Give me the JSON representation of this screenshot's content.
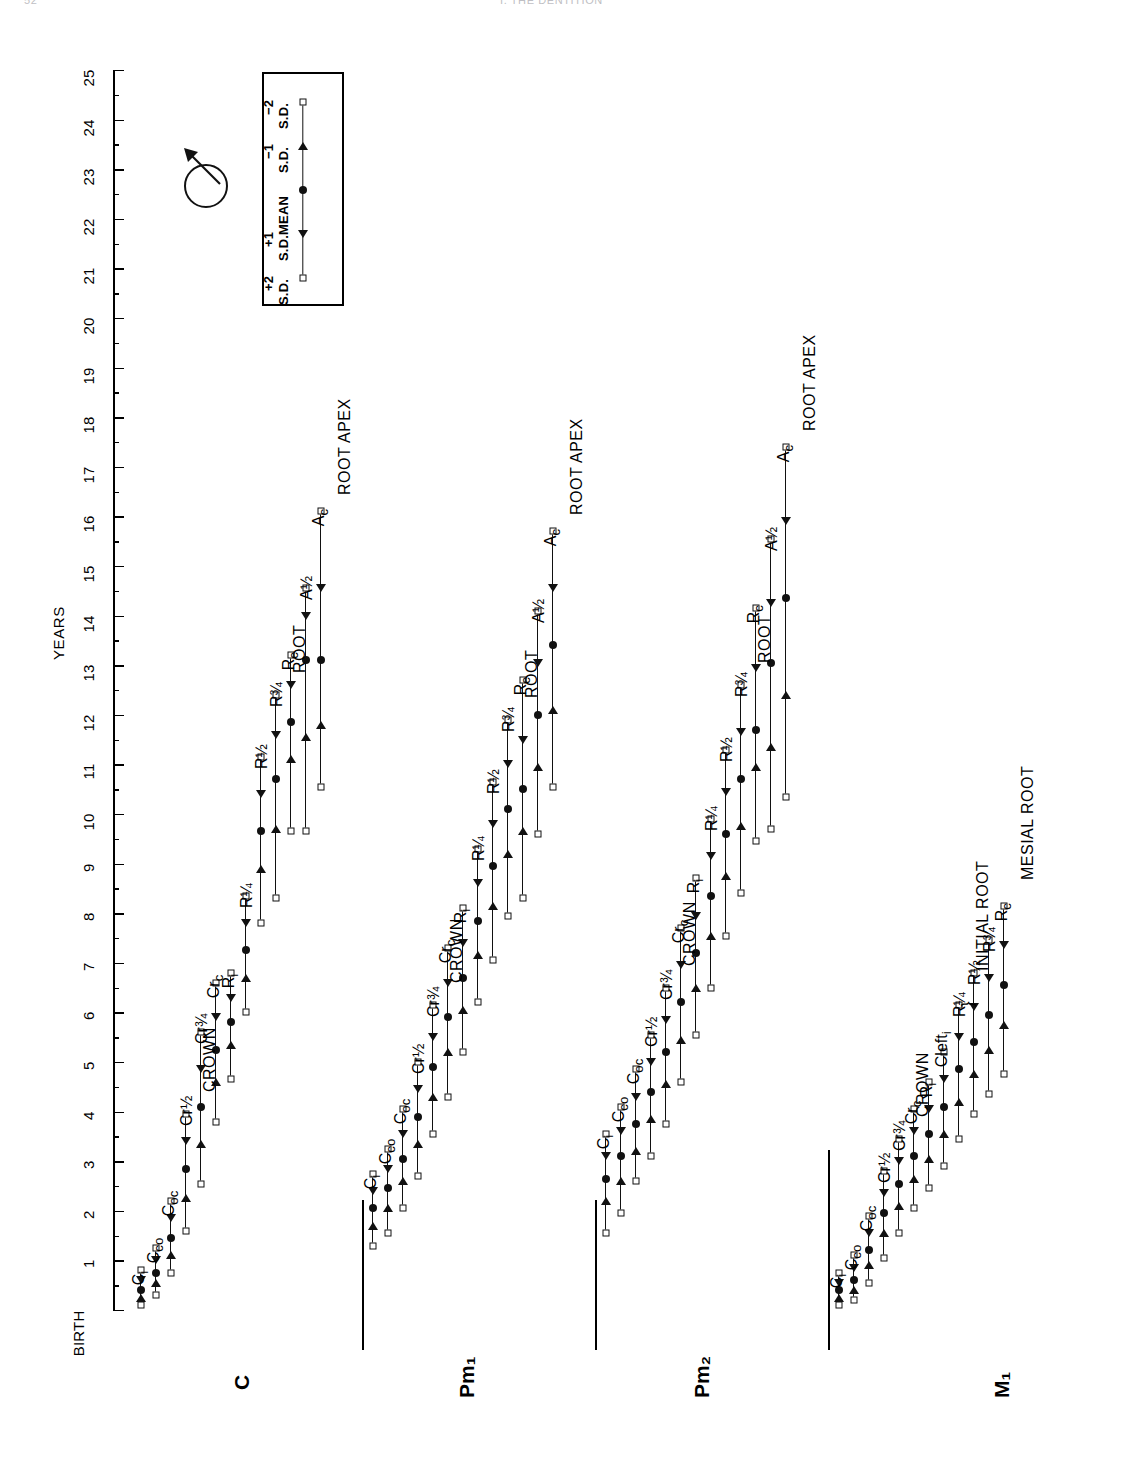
{
  "runhead": {
    "page": "52",
    "title": "I. THE DENTITION"
  },
  "axis": {
    "title": "YEARS",
    "origin_label": "BIRTH",
    "ticks": [
      "1",
      "2",
      "3",
      "4",
      "5",
      "6",
      "7",
      "8",
      "9",
      "10",
      "11",
      "12",
      "13",
      "14",
      "15",
      "16",
      "17",
      "18",
      "19",
      "20",
      "21",
      "22",
      "23",
      "24",
      "25"
    ],
    "min": 0,
    "max": 25
  },
  "legend": {
    "items": [
      {
        "label": "−2\nS.D.",
        "symbol": "square"
      },
      {
        "label": "−1\nS.D.",
        "symbol": "triangle"
      },
      {
        "label": "MEAN",
        "symbol": "circle"
      },
      {
        "label": "+1\nS.D.",
        "symbol": "triangle"
      },
      {
        "label": "+2\nS.D.",
        "symbol": "square"
      }
    ],
    "text_m2": "−2",
    "text_m2b": "S.D.",
    "text_m1": "−1",
    "text_m1b": "S.D.",
    "text_mean": "MEAN",
    "text_p1": "+1",
    "text_p1b": "S.D.",
    "text_p2": "+2",
    "text_p2b": "S.D."
  },
  "sex_symbol": {
    "name": "male-symbol",
    "meaning": "males"
  },
  "chart_data": {
    "type": "line",
    "xlabel": "YEARS",
    "ylabel": "",
    "xlim": [
      0,
      25
    ],
    "grid": false,
    "legend_position": "top-left-box",
    "marker_meaning": [
      "-2 S.D. (square)",
      "-1 S.D. (triangle)",
      "MEAN (filled circle)",
      "+1 S.D. (triangle)",
      "+2 S.D. (square)"
    ],
    "series": [
      {
        "name": "C",
        "group_labels": [
          "CROWN",
          "ROOT",
          "ROOT APEX"
        ],
        "stages": [
          {
            "stage": "Cᵢ",
            "label_html": "C<sub>i</sub>",
            "m2": 0.1,
            "m1": 0.25,
            "mean": 0.4,
            "p1": 0.6,
            "p2": 0.8
          },
          {
            "stage": "C_co",
            "label_html": "C<sub>co</sub>",
            "m2": 0.3,
            "m1": 0.55,
            "mean": 0.75,
            "p1": 1.0,
            "p2": 1.25
          },
          {
            "stage": "C_oc",
            "label_html": "C<sub>oc</sub>",
            "m2": 0.75,
            "m1": 1.1,
            "mean": 1.45,
            "p1": 1.85,
            "p2": 2.2
          },
          {
            "stage": "Cr½",
            "label_html": "Cr&frac12;",
            "m2": 1.6,
            "m1": 2.25,
            "mean": 2.85,
            "p1": 3.4,
            "p2": 3.95
          },
          {
            "stage": "Cr¾",
            "label_html": "Cr&frac34;",
            "m2": 2.55,
            "m1": 3.35,
            "mean": 4.1,
            "p1": 4.85,
            "p2": 5.6
          },
          {
            "stage": "Cr_c",
            "label_html": "Cr<sub>c</sub>",
            "m2": 3.8,
            "m1": 4.6,
            "mean": 5.25,
            "p1": 5.9,
            "p2": 6.6
          },
          {
            "stage": "Rᵢ",
            "label_html": "R<sub>i</sub>",
            "m2": 4.65,
            "m1": 5.35,
            "mean": 5.8,
            "p1": 6.3,
            "p2": 6.8
          },
          {
            "stage": "R¼",
            "label_html": "R&frac14;",
            "m2": 6.0,
            "m1": 6.7,
            "mean": 7.25,
            "p1": 7.8,
            "p2": 8.35
          },
          {
            "stage": "R½",
            "label_html": "R&frac12;",
            "m2": 7.8,
            "m1": 8.9,
            "mean": 9.65,
            "p1": 10.4,
            "p2": 11.15
          },
          {
            "stage": "R¾",
            "label_html": "R&frac34;",
            "m2": 8.3,
            "m1": 9.7,
            "mean": 10.7,
            "p1": 11.6,
            "p2": 12.4
          },
          {
            "stage": "R_c",
            "label_html": "R<sub>c</sub>",
            "m2": 9.65,
            "m1": 11.1,
            "mean": 11.85,
            "p1": 12.6,
            "p2": 13.2
          },
          {
            "stage": "A½",
            "label_html": "A&frac12;",
            "m2": 9.65,
            "m1": 11.55,
            "mean": 13.1,
            "p1": 14.0,
            "p2": 14.55
          },
          {
            "stage": "A_c",
            "label_html": "A<sub>c</sub>",
            "m2": 10.55,
            "m1": 11.8,
            "mean": 13.1,
            "p1": 14.55,
            "p2": 16.1
          }
        ]
      },
      {
        "name": "Pm₁",
        "group_labels": [
          "CROWN",
          "ROOT",
          "ROOT APEX"
        ],
        "stages": [
          {
            "stage": "Cᵢ",
            "label_html": "C<sub>i</sub>",
            "m2": 1.3,
            "m1": 1.7,
            "mean": 2.05,
            "p1": 2.4,
            "p2": 2.75
          },
          {
            "stage": "C_co",
            "label_html": "C<sub>co</sub>",
            "m2": 1.55,
            "m1": 2.05,
            "mean": 2.45,
            "p1": 2.85,
            "p2": 3.25
          },
          {
            "stage": "C_oc",
            "label_html": "C<sub>oc</sub>",
            "m2": 2.05,
            "m1": 2.6,
            "mean": 3.05,
            "p1": 3.55,
            "p2": 4.05
          },
          {
            "stage": "Cr½",
            "label_html": "Cr&frac12;",
            "m2": 2.7,
            "m1": 3.35,
            "mean": 3.9,
            "p1": 4.45,
            "p2": 5.0
          },
          {
            "stage": "Cr¾",
            "label_html": "Cr&frac34;",
            "m2": 3.55,
            "m1": 4.3,
            "mean": 4.9,
            "p1": 5.5,
            "p2": 6.15
          },
          {
            "stage": "Cr_c",
            "label_html": "Cr<sub>c</sub>",
            "m2": 4.3,
            "m1": 5.2,
            "mean": 5.9,
            "p1": 6.6,
            "p2": 7.3
          },
          {
            "stage": "Rᵢ",
            "label_html": "R<sub>i</sub>",
            "m2": 5.2,
            "m1": 6.05,
            "mean": 6.7,
            "p1": 7.4,
            "p2": 8.1
          },
          {
            "stage": "R¼",
            "label_html": "R&frac14;",
            "m2": 6.2,
            "m1": 7.15,
            "mean": 7.85,
            "p1": 8.6,
            "p2": 9.3
          },
          {
            "stage": "R½",
            "label_html": "R&frac12;",
            "m2": 7.05,
            "m1": 8.15,
            "mean": 8.95,
            "p1": 9.8,
            "p2": 10.65
          },
          {
            "stage": "R¾",
            "label_html": "R&frac34;",
            "m2": 7.95,
            "m1": 9.2,
            "mean": 10.1,
            "p1": 11.0,
            "p2": 11.9
          },
          {
            "stage": "R_c",
            "label_html": "R<sub>c</sub>",
            "m2": 8.3,
            "m1": 9.65,
            "mean": 10.5,
            "p1": 11.5,
            "p2": 12.7
          },
          {
            "stage": "A½",
            "label_html": "A&frac12;",
            "m2": 9.6,
            "m1": 10.95,
            "mean": 12.0,
            "p1": 13.05,
            "p2": 14.1
          },
          {
            "stage": "A_c",
            "label_html": "A<sub>c</sub>",
            "m2": 10.55,
            "m1": 12.1,
            "mean": 13.4,
            "p1": 14.55,
            "p2": 15.7
          }
        ]
      },
      {
        "name": "Pm₂",
        "group_labels": [
          "CROWN",
          "ROOT",
          "ROOT APEX"
        ],
        "stages": [
          {
            "stage": "Cᵢ",
            "label_html": "C<sub>i</sub>",
            "m2": 1.55,
            "m1": 2.2,
            "mean": 2.65,
            "p1": 3.1,
            "p2": 3.55
          },
          {
            "stage": "C_co",
            "label_html": "C<sub>co</sub>",
            "m2": 1.95,
            "m1": 2.6,
            "mean": 3.1,
            "p1": 3.6,
            "p2": 4.1
          },
          {
            "stage": "C_oc",
            "label_html": "C<sub>oc</sub>",
            "m2": 2.6,
            "m1": 3.2,
            "mean": 3.75,
            "p1": 4.3,
            "p2": 4.85
          },
          {
            "stage": "Cr½",
            "label_html": "Cr&frac12;",
            "m2": 3.1,
            "m1": 3.85,
            "mean": 4.4,
            "p1": 5.0,
            "p2": 5.55
          },
          {
            "stage": "Cr¾",
            "label_html": "Cr&frac34;",
            "m2": 3.75,
            "m1": 4.55,
            "mean": 5.2,
            "p1": 5.85,
            "p2": 6.5
          },
          {
            "stage": "Cr_c",
            "label_html": "Cr<sub>c</sub>",
            "m2": 4.6,
            "m1": 5.45,
            "mean": 6.2,
            "p1": 6.95,
            "p2": 7.7
          },
          {
            "stage": "Rᵢ",
            "label_html": "R<sub>i</sub>",
            "m2": 5.55,
            "m1": 6.5,
            "mean": 7.2,
            "p1": 7.95,
            "p2": 8.7
          },
          {
            "stage": "R¼",
            "label_html": "R&frac14;",
            "m2": 6.5,
            "m1": 7.55,
            "mean": 8.35,
            "p1": 9.15,
            "p2": 9.9
          },
          {
            "stage": "R½",
            "label_html": "R&frac12;",
            "m2": 7.55,
            "m1": 8.75,
            "mean": 9.6,
            "p1": 10.45,
            "p2": 11.3
          },
          {
            "stage": "R¾",
            "label_html": "R&frac34;",
            "m2": 8.4,
            "m1": 9.75,
            "mean": 10.7,
            "p1": 11.65,
            "p2": 12.6
          },
          {
            "stage": "R_c",
            "label_html": "R<sub>c</sub>",
            "m2": 9.45,
            "m1": 10.95,
            "mean": 11.7,
            "p1": 12.95,
            "p2": 14.15
          },
          {
            "stage": "A½",
            "label_html": "A&frac12;",
            "m2": 9.7,
            "m1": 11.35,
            "mean": 13.05,
            "p1": 14.25,
            "p2": 15.55
          },
          {
            "stage": "A_c",
            "label_html": "A<sub>c</sub>",
            "m2": 10.35,
            "m1": 12.4,
            "mean": 14.35,
            "p1": 15.9,
            "p2": 17.4
          }
        ]
      },
      {
        "name": "M₁",
        "group_labels": [
          "CROWN",
          "INITIAL ROOT",
          "MESIAL ROOT"
        ],
        "stages": [
          {
            "stage": "Cᵢ",
            "label_html": "C<sub>i</sub>",
            "m2": 0.1,
            "m1": 0.25,
            "mean": 0.4,
            "p1": 0.55,
            "p2": 0.75
          },
          {
            "stage": "C_co",
            "label_html": "C<sub>co</sub>",
            "m2": 0.2,
            "m1": 0.4,
            "mean": 0.6,
            "p1": 0.85,
            "p2": 1.1
          },
          {
            "stage": "C_oc",
            "label_html": "C<sub>oc</sub>",
            "m2": 0.55,
            "m1": 0.9,
            "mean": 1.2,
            "p1": 1.55,
            "p2": 1.9
          },
          {
            "stage": "Cr½",
            "label_html": "Cr&frac12;",
            "m2": 1.05,
            "m1": 1.55,
            "mean": 1.95,
            "p1": 2.35,
            "p2": 2.8
          },
          {
            "stage": "Cr¾",
            "label_html": "Cr&frac34;",
            "m2": 1.55,
            "m1": 2.1,
            "mean": 2.55,
            "p1": 3.0,
            "p2": 3.45
          },
          {
            "stage": "Cr_c",
            "label_html": "Cr<sub>c</sub>",
            "m2": 2.05,
            "m1": 2.65,
            "mean": 3.1,
            "p1": 3.6,
            "p2": 4.05
          },
          {
            "stage": "Rᵢ",
            "label_html": "R<sub>i</sub>",
            "m2": 2.45,
            "m1": 3.05,
            "mean": 3.55,
            "p1": 4.05,
            "p2": 4.6
          },
          {
            "stage": "Cleftᵢ",
            "label_html": "Cleft<sub>i</sub>",
            "m2": 2.9,
            "m1": 3.55,
            "mean": 4.1,
            "p1": 4.65,
            "p2": 5.2
          },
          {
            "stage": "R¼",
            "label_html": "R&frac14;",
            "m2": 3.45,
            "m1": 4.2,
            "mean": 4.85,
            "p1": 5.5,
            "p2": 6.15
          },
          {
            "stage": "R½",
            "label_html": "R&frac12;",
            "m2": 3.95,
            "m1": 4.75,
            "mean": 5.4,
            "p1": 6.1,
            "p2": 6.8
          },
          {
            "stage": "R¾",
            "label_html": "R&frac34;",
            "m2": 4.35,
            "m1": 5.25,
            "mean": 5.95,
            "p1": 6.7,
            "p2": 7.45
          },
          {
            "stage": "R_c",
            "label_html": "R<sub>c</sub>",
            "m2": 4.75,
            "m1": 5.75,
            "mean": 6.55,
            "p1": 7.35,
            "p2": 8.15
          }
        ]
      }
    ]
  }
}
